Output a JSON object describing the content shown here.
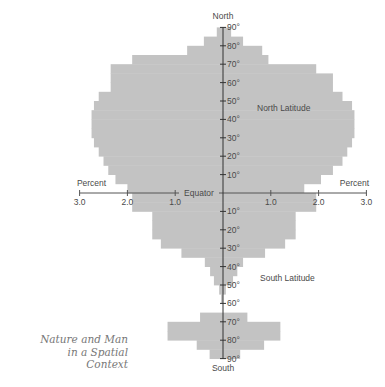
{
  "chart_data": {
    "type": "bar",
    "subtype": "two-sided horizontal histogram (latitude profile)",
    "title": "",
    "top_label": "North",
    "bottom_label": "South",
    "equator_label": "Equator",
    "north_label": "North Latitude",
    "south_label": "South Latitude",
    "xlabel_left": "Percent",
    "xlabel_right": "Percent",
    "x_ticks": [
      3.0,
      2.0,
      1.0,
      1.0,
      2.0,
      3.0
    ],
    "x_tick_labels": [
      "3.0",
      "2.0",
      "1.0",
      "1.0",
      "2.0",
      "3.0"
    ],
    "xlim": [
      3.0,
      3.0
    ],
    "lat_ticks_north": [
      "10°",
      "20°",
      "30°",
      "40°",
      "50°",
      "60°",
      "70°",
      "80°",
      "90°"
    ],
    "lat_ticks_south": [
      "10°",
      "20°",
      "30°",
      "40°",
      "50°",
      "60°",
      "70°",
      "80°",
      "90°"
    ],
    "band_size_degrees": 5,
    "north": [
      {
        "band": "0-5",
        "left": 2.0,
        "right": 1.7
      },
      {
        "band": "5-10",
        "left": 2.25,
        "right": 2.05
      },
      {
        "band": "10-15",
        "left": 2.4,
        "right": 2.3
      },
      {
        "band": "15-20",
        "left": 2.5,
        "right": 2.5
      },
      {
        "band": "20-25",
        "left": 2.6,
        "right": 2.6
      },
      {
        "band": "25-30",
        "left": 2.7,
        "right": 2.7
      },
      {
        "band": "30-35",
        "left": 2.75,
        "right": 2.75
      },
      {
        "band": "35-40",
        "left": 2.75,
        "right": 2.75
      },
      {
        "band": "40-45",
        "left": 2.75,
        "right": 2.75
      },
      {
        "band": "45-50",
        "left": 2.7,
        "right": 2.7
      },
      {
        "band": "50-55",
        "left": 2.6,
        "right": 2.5
      },
      {
        "band": "55-60",
        "left": 2.35,
        "right": 2.3
      },
      {
        "band": "60-65",
        "left": 2.35,
        "right": 2.3
      },
      {
        "band": "65-70",
        "left": 2.35,
        "right": 1.95
      },
      {
        "band": "70-75",
        "left": 1.9,
        "right": 0.95
      },
      {
        "band": "75-80",
        "left": 0.75,
        "right": 0.82
      },
      {
        "band": "80-85",
        "left": 0.4,
        "right": 0.42
      },
      {
        "band": "85-90",
        "left": 0.13,
        "right": 0.17
      }
    ],
    "south": [
      {
        "band": "0-5",
        "left": 1.9,
        "right": 1.95
      },
      {
        "band": "5-10",
        "left": 1.9,
        "right": 1.95
      },
      {
        "band": "10-15",
        "left": 1.48,
        "right": 1.52
      },
      {
        "band": "15-20",
        "left": 1.48,
        "right": 1.52
      },
      {
        "band": "20-25",
        "left": 1.48,
        "right": 1.52
      },
      {
        "band": "25-30",
        "left": 1.3,
        "right": 1.3
      },
      {
        "band": "30-35",
        "left": 0.87,
        "right": 0.88
      },
      {
        "band": "35-40",
        "left": 0.38,
        "right": 0.42
      },
      {
        "band": "40-45",
        "left": 0.27,
        "right": 0.3
      },
      {
        "band": "45-50",
        "left": 0.19,
        "right": 0.21
      },
      {
        "band": "50-55",
        "left": 0.08,
        "right": 0.06
      },
      {
        "band": "55-60",
        "left": 0.04,
        "right": 0.0
      },
      {
        "band": "60-65",
        "left": 0.0,
        "right": 0.0
      },
      {
        "band": "65-70",
        "left": 0.48,
        "right": 0.51
      },
      {
        "band": "70-75",
        "left": 1.16,
        "right": 1.2
      },
      {
        "band": "75-80",
        "left": 1.16,
        "right": 1.2
      },
      {
        "band": "80-85",
        "left": 0.55,
        "right": 0.86
      },
      {
        "band": "85-90",
        "left": 0.28,
        "right": 0.36
      }
    ]
  },
  "caption": {
    "lines": [
      "Nature and Man",
      "in a Spatial",
      "Context"
    ]
  }
}
